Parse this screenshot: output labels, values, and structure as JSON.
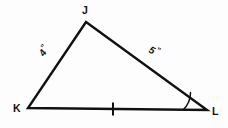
{
  "figure": {
    "kind": "geometry-diagram",
    "shape": "triangle",
    "name": "Triangle JKL",
    "background_color": "#fdfdfd",
    "stroke_color": "#111111",
    "vertices": [
      {
        "id": "J",
        "label": "J",
        "x": 86,
        "y": 22,
        "label_x": 82,
        "label_y": 14
      },
      {
        "id": "K",
        "label": "K",
        "x": 28,
        "y": 108,
        "label_x": 13,
        "label_y": 112
      },
      {
        "id": "L",
        "label": "L",
        "x": 207,
        "y": 110,
        "label_x": 212,
        "label_y": 115
      }
    ],
    "sides": [
      {
        "id": "KJ",
        "from": "K",
        "to": "J",
        "label": "4",
        "unit_mark": "”",
        "label_x": 44,
        "label_y": 57,
        "label_rotation": -56
      },
      {
        "id": "JL",
        "from": "J",
        "to": "L",
        "label": "5",
        "unit_mark": "”",
        "label_x": 148,
        "label_y": 52,
        "label_rotation": 27
      },
      {
        "id": "KL",
        "from": "K",
        "to": "L",
        "label": "",
        "unit_mark": "",
        "label_x": 0,
        "label_y": 0,
        "label_rotation": 0
      }
    ],
    "congruence_marks": [
      {
        "on_side": "KL",
        "ticks": 1,
        "x": 113,
        "y": 109,
        "length": 13
      }
    ],
    "angle_marks": [
      {
        "at_vertex": "L",
        "arcs": 1,
        "radius": 24
      }
    ]
  }
}
